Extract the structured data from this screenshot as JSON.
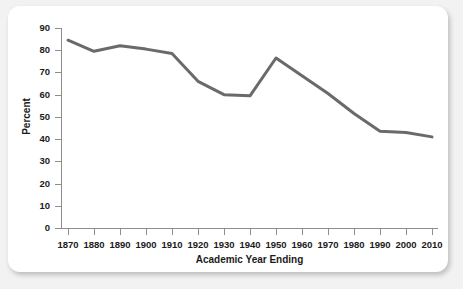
{
  "chart_data": {
    "type": "line",
    "title": "",
    "xlabel": "Academic Year Ending",
    "ylabel": "Percent",
    "grid": false,
    "legend": "none",
    "xlim": [
      1870,
      2010
    ],
    "ylim": [
      0,
      90
    ],
    "ytick_step": 10,
    "x": [
      1870,
      1880,
      1890,
      1900,
      1910,
      1920,
      1930,
      1940,
      1950,
      1960,
      1970,
      1980,
      1990,
      2000,
      2010
    ],
    "categories": [
      "1870",
      "1880",
      "1890",
      "1900",
      "1910",
      "1920",
      "1930",
      "1940",
      "1950",
      "1960",
      "1970",
      "1980",
      "1990",
      "2000",
      "2010"
    ],
    "ytick_labels": [
      "90",
      "80",
      "70",
      "60",
      "50",
      "40",
      "30",
      "20",
      "10",
      "0"
    ],
    "ytick_values": [
      90,
      80,
      70,
      60,
      50,
      40,
      30,
      20,
      10,
      0
    ],
    "series": [
      {
        "name": "Percent",
        "color": "#6a6a6a",
        "values": [
          84.5,
          79.5,
          82.0,
          80.5,
          78.5,
          66.0,
          60.0,
          59.5,
          76.5,
          68.5,
          60.5,
          51.5,
          43.5,
          43.0,
          41.0
        ]
      }
    ],
    "line_color": "#6a6a6a",
    "line_width": 3
  },
  "figure": {
    "panel_background": "#ffffff",
    "page_background": "#f2f2f2",
    "axis_color": "#8d8d8d"
  }
}
